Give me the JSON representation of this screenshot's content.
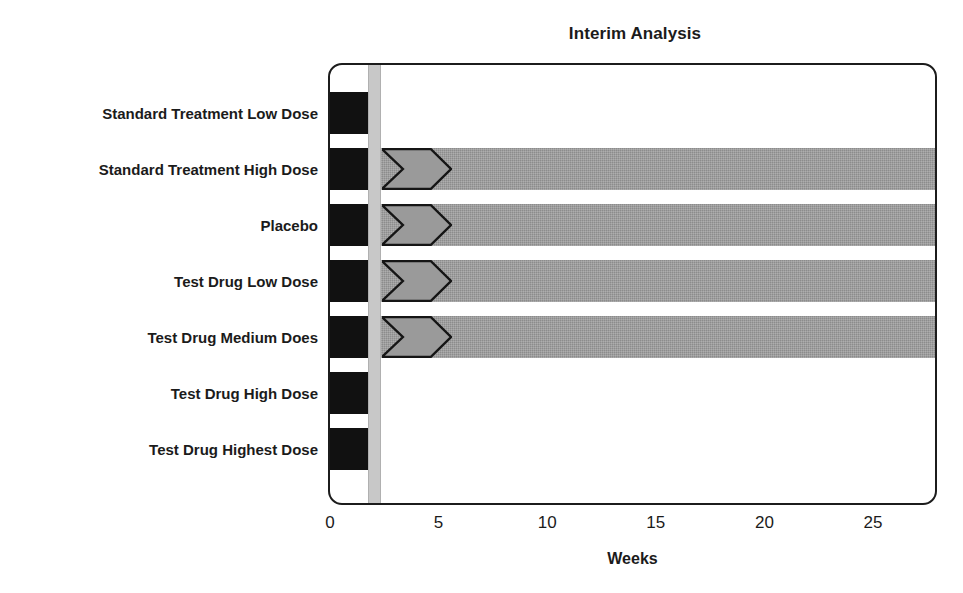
{
  "chart_data": {
    "type": "bar",
    "title": "Interim Analysis",
    "xlabel": "Weeks",
    "ylabel": "",
    "xlim": [
      0,
      28
    ],
    "ylim": [
      0,
      7
    ],
    "grid": false,
    "legend": "none",
    "orientation": "horizontal",
    "xticks": [
      0,
      5,
      10,
      15,
      20,
      25
    ],
    "xticklabels": [
      "0",
      "5",
      "10",
      "15",
      "20",
      "25"
    ],
    "annotations": [
      {
        "name": "interim-analysis-marker",
        "label": "Interim Analysis",
        "x_start": 1.75,
        "x_end": 2.35,
        "color": "#c8c8c8"
      }
    ],
    "categories": [
      "Standard Treatment Low Dose",
      "Standard Treatment High Dose",
      "Placebo",
      "Test Drug Low Dose",
      "Test Drug Medium Does",
      "Test Drug High Dose",
      "Test Drug Highest Dose"
    ],
    "series": [
      {
        "name": "Run-in / Screening",
        "color": "#111111",
        "values": [
          1.75,
          1.75,
          1.75,
          1.75,
          1.75,
          1.75,
          1.75
        ]
      },
      {
        "name": "Treatment",
        "color": "#8c8c8c",
        "values": [
          0,
          28,
          28,
          28,
          28,
          0,
          0
        ]
      }
    ],
    "bars": [
      {
        "category": "Standard Treatment Low Dose",
        "black_start": 0,
        "black_end": 1.75,
        "grey_start": null,
        "grey_end": null,
        "chevron": false
      },
      {
        "category": "Standard Treatment High Dose",
        "black_start": 0,
        "black_end": 1.75,
        "grey_start": 2.35,
        "grey_end": 28,
        "chevron": true,
        "chevron_start": 2.4,
        "chevron_end": 5.6
      },
      {
        "category": "Placebo",
        "black_start": 0,
        "black_end": 1.75,
        "grey_start": 2.35,
        "grey_end": 28,
        "chevron": true,
        "chevron_start": 2.4,
        "chevron_end": 5.6
      },
      {
        "category": "Test Drug Low Dose",
        "black_start": 0,
        "black_end": 1.75,
        "grey_start": 2.35,
        "grey_end": 28,
        "chevron": true,
        "chevron_start": 2.4,
        "chevron_end": 5.6
      },
      {
        "category": "Test Drug Medium Does",
        "black_start": 0,
        "black_end": 1.75,
        "grey_start": 2.35,
        "grey_end": 28,
        "chevron": true,
        "chevron_start": 2.4,
        "chevron_end": 5.6
      },
      {
        "category": "Test Drug High Dose",
        "black_start": 0,
        "black_end": 1.75,
        "grey_start": null,
        "grey_end": null,
        "chevron": false
      },
      {
        "category": "Test Drug Highest Dose",
        "black_start": 0,
        "black_end": 1.75,
        "grey_start": null,
        "grey_end": null,
        "chevron": false
      }
    ]
  },
  "colors": {
    "black_segment": "#111111",
    "grey_segment": "#8c8c8c",
    "interim_band": "#c8c8c8",
    "frame": "#1c1c1c",
    "text": "#1b1b1b",
    "background": "#ffffff"
  }
}
